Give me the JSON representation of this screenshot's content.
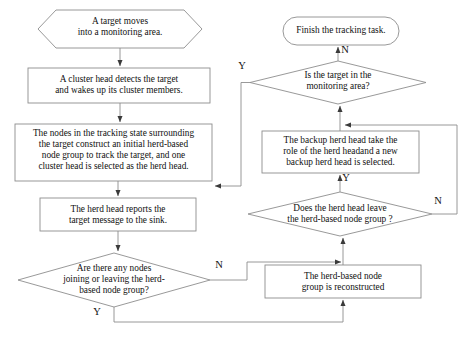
{
  "diagram": {
    "stroke_color": "#888888",
    "text_color": "#111111",
    "background": "#ffffff",
    "nodes": [
      {
        "id": "start",
        "shape": "hexagon",
        "label": "A target moves\ninto a monitoring area.",
        "x": 38,
        "y": 10,
        "w": 164,
        "h": 38
      },
      {
        "id": "cluster-head-detects",
        "shape": "rect",
        "label": "A  cluster head detects the target\nand wakes up its cluster members.",
        "x": 28,
        "y": 68,
        "w": 182,
        "h": 35
      },
      {
        "id": "nodes-construct-herd",
        "shape": "rect",
        "label": "The nodes in the tracking state surrounding\nthe target construct an initial herd-based\nnode group to track the target, and one\ncluster head is selected as the herd head.",
        "x": 15,
        "y": 124,
        "w": 197,
        "h": 57
      },
      {
        "id": "herd-head-reports",
        "shape": "rect",
        "label": "The herd head reports the\ntarget message to the sink.",
        "x": 40,
        "y": 198,
        "w": 156,
        "h": 33
      },
      {
        "id": "nodes-joining-leaving",
        "shape": "diamond",
        "label": "Are there any nodes\njoining or leaving the herd-\nbased node group?",
        "x": 18,
        "y": 253,
        "w": 192,
        "h": 54
      },
      {
        "id": "finish",
        "shape": "terminator",
        "label": "Finish the tracking task.",
        "x": 283,
        "y": 17,
        "w": 116,
        "h": 28
      },
      {
        "id": "target-in-area",
        "shape": "diamond",
        "label": "Is the target in the\nmonitoring area?",
        "x": 250,
        "y": 61,
        "w": 176,
        "h": 43
      },
      {
        "id": "backup-herd-head",
        "shape": "rect",
        "label": "The backup herd head take the\nrole of the herd headand a new\nbackup herd head is selected.",
        "x": 262,
        "y": 131,
        "w": 157,
        "h": 42
      },
      {
        "id": "herd-head-leave",
        "shape": "diamond",
        "label": "Does the herd head leave\nthe herd-based node group ?",
        "x": 248,
        "y": 192,
        "w": 184,
        "h": 44
      },
      {
        "id": "group-reconstructed",
        "shape": "rect",
        "label": "The herd-based node\ngroup is reconstructed",
        "x": 265,
        "y": 265,
        "w": 156,
        "h": 33
      }
    ],
    "branch_labels": [
      {
        "id": "branch-target-in-area-no",
        "text": "N",
        "x": 344,
        "y": 48
      },
      {
        "id": "branch-target-in-area-yes",
        "text": "Y",
        "x": 241,
        "y": 64
      },
      {
        "id": "branch-herd-head-leave-yes",
        "text": "Y",
        "x": 345,
        "y": 176
      },
      {
        "id": "branch-herd-head-leave-no",
        "text": "N",
        "x": 437,
        "y": 199
      },
      {
        "id": "branch-nodes-change-no",
        "text": "N",
        "x": 218,
        "y": 263
      },
      {
        "id": "branch-nodes-change-yes",
        "text": "Y",
        "x": 96,
        "y": 310
      }
    ]
  }
}
